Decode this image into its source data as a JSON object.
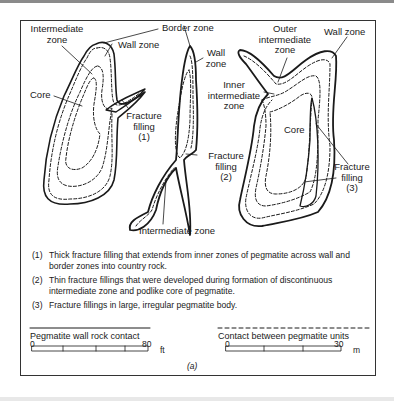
{
  "figure": {
    "caption": "(a)",
    "labels": {
      "body1_intermediate_zone": [
        "Intermediate",
        "zone"
      ],
      "body1_wall_zone": "Wall zone",
      "body1_core": "Core",
      "body1_fracture_filling": [
        "Fracture",
        "filling",
        "(1)"
      ],
      "border_zone": "Border zone",
      "body2_wall_zone": [
        "Wall",
        "zone"
      ],
      "body2_inner_intermediate_zone": [
        "Inner",
        "intermediate",
        "zone"
      ],
      "body2_fracture_filling": [
        "Fracture",
        "filling",
        "(2)"
      ],
      "body2_intermediate_zone": "Intermediate zone",
      "body3_outer_intermediate_zone": [
        "Outer",
        "intermediate",
        "zone"
      ],
      "body3_wall_zone": "Wall zone",
      "body3_core": "Core",
      "body3_fracture_filling": [
        "Fracture",
        "filling",
        "(3)"
      ]
    },
    "notes": [
      {
        "num": "(1)",
        "text": "Thick fracture filling that extends from inner zones of pegmatite across wall and border zones into country rock."
      },
      {
        "num": "(2)",
        "text": "Thin fracture fillings that were developed during formation of discontinuous intermediate zone and podlike core of pegmatite."
      },
      {
        "num": "(3)",
        "text": "Fracture fillings in large, irregular pegmatite body."
      }
    ],
    "legend": {
      "solid_line": "Pegmatite wall rock contact",
      "dashed_line": "Contact between pegmatite units",
      "scale_ft": {
        "start": "0",
        "end": "80",
        "unit": "ft"
      },
      "scale_m": {
        "start": "0",
        "end": "30",
        "unit": "m"
      }
    },
    "colors": {
      "line": "#1a1a1a",
      "background": "#ffffff",
      "frame": "#333333"
    }
  }
}
